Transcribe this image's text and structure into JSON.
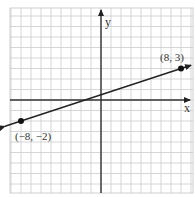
{
  "chart_data": {
    "type": "line",
    "title": "",
    "xlabel": "x",
    "ylabel": "y",
    "xlim": [
      -9,
      9
    ],
    "ylim": [
      -9,
      9
    ],
    "grid": true,
    "series": [
      {
        "name": "line through (-8,-2) and (8,3)",
        "x": [
          -8,
          8
        ],
        "y": [
          -2,
          3
        ],
        "slope": 0.3125,
        "intercept": 0.5,
        "arrows_both_ends": true
      }
    ],
    "points": [
      {
        "x": 8,
        "y": 3,
        "label": "(8, 3)"
      },
      {
        "x": -8,
        "y": -2,
        "label": "(−8, −2)"
      }
    ],
    "colors": {
      "grid": "#c8c8c8",
      "axis": "#333333",
      "line": "#222222",
      "background": "#ffffff"
    }
  },
  "labels": {
    "x_axis": "x",
    "y_axis": "y",
    "point_a": "(8, 3)",
    "point_b": "(−8, −2)"
  }
}
